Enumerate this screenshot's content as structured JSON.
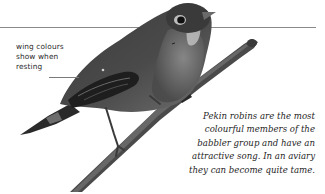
{
  "annotation": {
    "lines": [
      "wing colours",
      "show when",
      "resting"
    ]
  },
  "caption": {
    "lines": [
      "Pekin robins are the most",
      "colourful members of the",
      "babbler group and have an",
      "attractive song. In an aviary",
      "they can become quite tame."
    ]
  },
  "illustration": {
    "subject": "pekin-robin-on-branch",
    "colors": {
      "bird_dark": "#2b2b2b",
      "bird_mid": "#5a5a5a",
      "bird_light": "#9a9a9a",
      "branch": "#3a3a3a",
      "rule": "#8a8a8a"
    }
  }
}
